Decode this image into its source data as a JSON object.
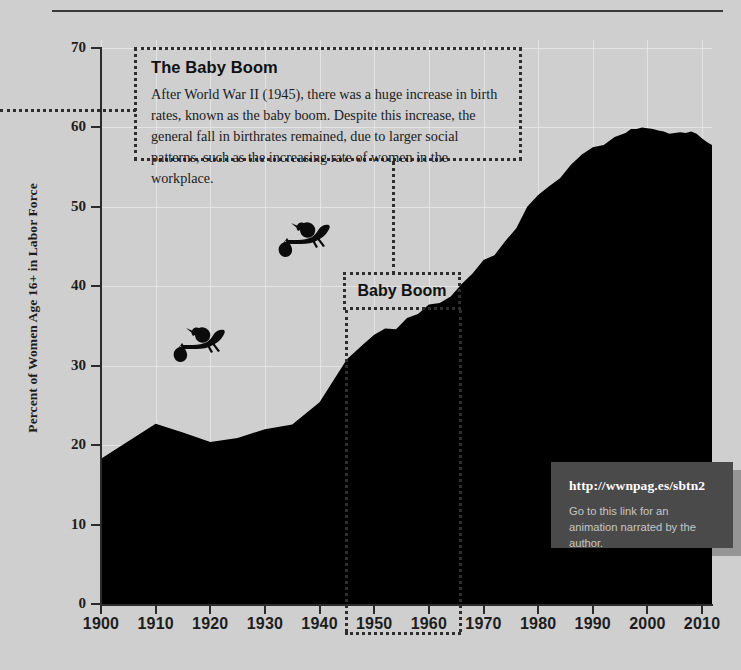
{
  "chart_data": {
    "type": "area",
    "title": "",
    "xlabel": "",
    "ylabel": "Percent of Women Age 16+ in Labor Force",
    "xlim": [
      1900,
      2012
    ],
    "ylim": [
      0,
      70
    ],
    "grid": true,
    "legend": "none",
    "y_ticks": [
      0,
      10,
      20,
      30,
      40,
      50,
      60,
      70
    ],
    "x_ticks": [
      1900,
      1910,
      1920,
      1930,
      1940,
      1950,
      1960,
      1970,
      1980,
      1990,
      2000,
      2010
    ],
    "series_name": "Percent of Women Age 16+ in Labor Force",
    "fill_color": "#000000",
    "x": [
      1900,
      1905,
      1910,
      1915,
      1920,
      1925,
      1930,
      1935,
      1940,
      1945,
      1948,
      1950,
      1952,
      1954,
      1956,
      1958,
      1960,
      1962,
      1964,
      1966,
      1968,
      1970,
      1972,
      1974,
      1976,
      1978,
      1980,
      1982,
      1984,
      1986,
      1988,
      1990,
      1992,
      1994,
      1996,
      1997,
      1998,
      1999,
      2000,
      2001,
      2002,
      2003,
      2004,
      2005,
      2006,
      2007,
      2008,
      2009,
      2010,
      2011,
      2012
    ],
    "values": [
      18.3,
      20.5,
      22.7,
      21.6,
      20.4,
      20.9,
      22.0,
      22.6,
      25.4,
      30.8,
      32.7,
      33.9,
      34.7,
      34.6,
      36.0,
      36.5,
      37.7,
      37.9,
      38.7,
      40.3,
      41.6,
      43.3,
      43.9,
      45.7,
      47.3,
      50.0,
      51.5,
      52.6,
      53.6,
      55.3,
      56.6,
      57.5,
      57.8,
      58.8,
      59.3,
      59.8,
      59.8,
      60.0,
      59.9,
      59.8,
      59.6,
      59.5,
      59.2,
      59.3,
      59.4,
      59.3,
      59.5,
      59.2,
      58.6,
      58.1,
      57.7
    ],
    "annotations": [
      {
        "id": "baby-boom-callout",
        "title": "The Baby Boom",
        "body": "After World War II (1945), there was a huge increase in birth rates, known as the baby boom. Despite this increase, the general fall in birthrates remained, due to larger social patterns, such as the increasing rate of women in the workplace."
      },
      {
        "id": "baby-boom-span",
        "label": "Baby Boom",
        "span_start": 1947,
        "span_end": 1964
      }
    ]
  },
  "y_axis": {
    "title": "Percent of Women Age 16+ in Labor Force",
    "ticks": [
      "70",
      "60",
      "50",
      "40",
      "30",
      "20",
      "10",
      "0"
    ]
  },
  "x_axis": {
    "ticks": [
      "1900",
      "1910",
      "1920",
      "1930",
      "1940",
      "1950",
      "1960",
      "1970",
      "1980",
      "1990",
      "2000",
      "2010"
    ]
  },
  "annotation": {
    "title": "The Baby Boom",
    "body": "After World War II (1945), there was a huge increase in birth rates, known as the baby boom. Despite this increase, the general fall in birthrates remained, due to larger social patterns, such as the increasing rate of women in the workplace."
  },
  "baby_boom": {
    "label": "Baby Boom"
  },
  "url_callout": {
    "link": "http://wwnpag.es/sbtn2",
    "caption": "Go to this link for an animation narrated by the author."
  },
  "icons": {
    "stork_1": "stork-with-bundle-icon",
    "stork_2": "stork-with-bundle-icon"
  },
  "colors": {
    "background": "#cfcfcf",
    "area_fill": "#000000",
    "axis": "#2b2b2b",
    "callout_background": "#4a4a4a",
    "gridline": "#ffffff"
  }
}
